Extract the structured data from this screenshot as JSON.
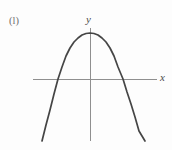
{
  "figure": {
    "part_label": "(l)",
    "width": 172,
    "height": 150,
    "background_color": "#fdfdfd"
  },
  "axes": {
    "x_label": "x",
    "y_label": "y",
    "axis_color": "#8f8f8f",
    "axis_stroke_width": 1,
    "x_axis": {
      "x_start": 33,
      "x_end": 157,
      "y": 79
    },
    "y_axis": {
      "x": 90,
      "y_start": 28,
      "y_end": 141
    },
    "origin": {
      "x": 90,
      "y": 79
    }
  },
  "chart_data": {
    "type": "line",
    "title": "",
    "subtitle": "",
    "xlabel": "x",
    "ylabel": "y",
    "curve_name": "downward-opening parabola",
    "curve_color": "#454545",
    "curve_stroke_width": 1.7,
    "grid": false,
    "legend": null,
    "annotations": [],
    "tick_labels": {
      "x": [],
      "y": []
    },
    "axis_ranges_px": {
      "xlim": [
        33,
        157
      ],
      "ylim": [
        141,
        28
      ]
    },
    "vertex_px": {
      "x": 90,
      "y": 33
    },
    "roots_px": [
      58,
      123
    ],
    "endpoints_px": [
      {
        "x": 42,
        "y": 141
      },
      {
        "x": 145,
        "y": 141
      }
    ],
    "equation_form": "y = a(x - h)^2 + k, a < 0",
    "opens": "down",
    "x": [
      42,
      50,
      58,
      66,
      74,
      82,
      90,
      98,
      106,
      114,
      123,
      131,
      139,
      145
    ],
    "y": [
      141,
      110,
      79,
      56,
      42,
      35,
      33,
      35,
      42,
      56,
      79,
      104,
      131,
      141
    ],
    "path_points": [
      {
        "x": 42,
        "y": 141
      },
      {
        "x": 46,
        "y": 125
      },
      {
        "x": 50,
        "y": 110
      },
      {
        "x": 54,
        "y": 94
      },
      {
        "x": 58,
        "y": 79
      },
      {
        "x": 62,
        "y": 67
      },
      {
        "x": 66,
        "y": 56
      },
      {
        "x": 70,
        "y": 48
      },
      {
        "x": 74,
        "y": 42
      },
      {
        "x": 78,
        "y": 38
      },
      {
        "x": 82,
        "y": 35
      },
      {
        "x": 86,
        "y": 33.5
      },
      {
        "x": 90,
        "y": 33
      },
      {
        "x": 94,
        "y": 33.5
      },
      {
        "x": 98,
        "y": 35
      },
      {
        "x": 102,
        "y": 38
      },
      {
        "x": 106,
        "y": 42
      },
      {
        "x": 110,
        "y": 48
      },
      {
        "x": 114,
        "y": 56
      },
      {
        "x": 118,
        "y": 67
      },
      {
        "x": 123,
        "y": 79
      },
      {
        "x": 127,
        "y": 92
      },
      {
        "x": 131,
        "y": 104
      },
      {
        "x": 135,
        "y": 117
      },
      {
        "x": 139,
        "y": 131
      },
      {
        "x": 145,
        "y": 141
      }
    ]
  }
}
